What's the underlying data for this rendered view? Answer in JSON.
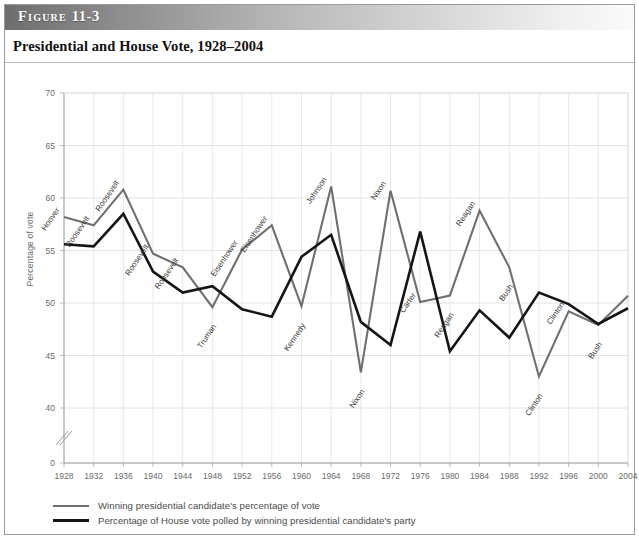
{
  "figure": {
    "banner_word": "Figure",
    "banner_number": "11-3",
    "title": "Presidential and House Vote, 1928–2004"
  },
  "legend": {
    "position": "below-axis",
    "items": [
      {
        "style": "gray-line",
        "color": "#6f6f6f",
        "label": "Winning presidential candidate's percentage of vote"
      },
      {
        "style": "black-line",
        "color": "#151515",
        "label": "Percentage of House vote polled by winning presidential candidate's party"
      }
    ]
  },
  "chart_data": {
    "type": "line",
    "title": "Presidential and House Vote, 1928–2004",
    "xlabel": "",
    "ylabel": "Percentage of vote",
    "grid": true,
    "axis_break": true,
    "xlim": [
      1928,
      2004
    ],
    "ylim": [
      40,
      70
    ],
    "yticks": [
      0,
      40,
      45,
      50,
      55,
      60,
      65,
      70
    ],
    "x": [
      1928,
      1932,
      1936,
      1940,
      1944,
      1948,
      1952,
      1956,
      1960,
      1964,
      1968,
      1972,
      1976,
      1980,
      1984,
      1988,
      1992,
      1996,
      2000,
      2004
    ],
    "xticks": [
      "1928",
      "1932",
      "1936",
      "1940",
      "1944",
      "1948",
      "1952",
      "1956",
      "1960",
      "1964",
      "1968",
      "1972",
      "1976",
      "1980",
      "1984",
      "1988",
      "1992",
      "1996",
      "2000",
      "2004"
    ],
    "series": [
      {
        "name": "Winning presidential candidate's percentage of vote",
        "color": "#6f6f6f",
        "values": [
          58.2,
          57.4,
          60.8,
          54.7,
          53.4,
          49.6,
          55.1,
          57.4,
          49.7,
          61.1,
          43.4,
          60.7,
          50.1,
          50.7,
          58.8,
          53.4,
          43.0,
          49.2,
          47.9,
          50.7
        ]
      },
      {
        "name": "Percentage of House vote polled by winning presidential candidate's party",
        "color": "#151515",
        "values": [
          55.6,
          55.4,
          58.5,
          53.0,
          51.0,
          51.6,
          49.4,
          48.7,
          54.4,
          56.5,
          48.2,
          46.0,
          56.8,
          45.4,
          49.3,
          46.7,
          51.0,
          49.9,
          48.0,
          49.5
        ]
      }
    ],
    "point_labels": [
      {
        "year": 1928,
        "series": "presidential",
        "text": "Hoover"
      },
      {
        "year": 1932,
        "series": "presidential",
        "text": "Roosevelt"
      },
      {
        "year": 1936,
        "series": "presidential",
        "text": "Roosevelt"
      },
      {
        "year": 1940,
        "series": "presidential",
        "text": "Roosevelt"
      },
      {
        "year": 1944,
        "series": "presidential",
        "text": "Roosevelt"
      },
      {
        "year": 1948,
        "series": "presidential",
        "text": "Truman"
      },
      {
        "year": 1952,
        "series": "presidential",
        "text": "Eisenhower"
      },
      {
        "year": 1956,
        "series": "presidential",
        "text": "Eisenhower"
      },
      {
        "year": 1960,
        "series": "presidential",
        "text": "Kennedy"
      },
      {
        "year": 1964,
        "series": "presidential",
        "text": "Johnson"
      },
      {
        "year": 1968,
        "series": "presidential",
        "text": "Nixon"
      },
      {
        "year": 1972,
        "series": "presidential",
        "text": "Nixon"
      },
      {
        "year": 1976,
        "series": "presidential",
        "text": "Carter"
      },
      {
        "year": 1980,
        "series": "presidential",
        "text": "Reagan"
      },
      {
        "year": 1984,
        "series": "presidential",
        "text": "Reagan"
      },
      {
        "year": 1988,
        "series": "presidential",
        "text": "Bush"
      },
      {
        "year": 1992,
        "series": "presidential",
        "text": "Clinton"
      },
      {
        "year": 1996,
        "series": "presidential",
        "text": "Clinton"
      },
      {
        "year": 2000,
        "series": "presidential",
        "text": "Bush"
      }
    ]
  }
}
